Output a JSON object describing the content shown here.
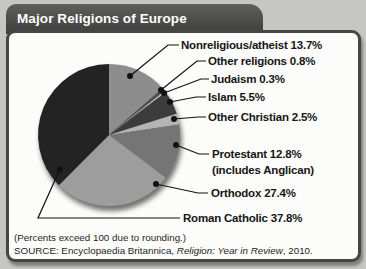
{
  "header": {
    "title": "Major Religions of Europe"
  },
  "chart_data": {
    "type": "pie",
    "title": "Major Religions of Europe",
    "start_angle_deg": -90,
    "direction": "clockwise",
    "legend_position": "right-callouts",
    "slices": [
      {
        "name": "Nonreligious/atheist",
        "value": 13.7,
        "label": "Nonreligious/atheist 13.7%",
        "color": "#8d8d8d"
      },
      {
        "name": "Other religions",
        "value": 0.8,
        "label": "Other religions 0.8%",
        "color": "#4f4f4f"
      },
      {
        "name": "Judaism",
        "value": 0.3,
        "label": "Judaism 0.3%",
        "color": "#c9c9c9"
      },
      {
        "name": "Islam",
        "value": 5.5,
        "label": "Islam 5.5%",
        "color": "#3c3c3c"
      },
      {
        "name": "Other Christian",
        "value": 2.5,
        "label": "Other Christian 2.5%",
        "color": "#b4b4b4"
      },
      {
        "name": "Protestant",
        "value": 12.8,
        "label": "Protestant 12.8%",
        "note": "(includes Anglican)",
        "color": "#757575"
      },
      {
        "name": "Orthodox",
        "value": 27.4,
        "label": "Orthodox 27.4%",
        "color": "#9d9d9d"
      },
      {
        "name": "Roman Catholic",
        "value": 37.8,
        "label": "Roman Catholic 37.8%",
        "color": "#232323"
      }
    ],
    "footnote": "(Percents exceed 100 due to rounding.)",
    "source_prefix": "SOURCE: Encyclopaedia Britannica, ",
    "source_italic": "Religion: Year in Review",
    "source_suffix": ", 2010.",
    "line_color": "#111111",
    "background_color": "#fcfcfa"
  }
}
